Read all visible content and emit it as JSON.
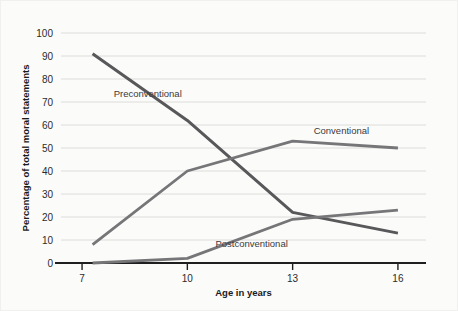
{
  "chart_data": {
    "type": "line",
    "title": "",
    "xlabel": "Age in years",
    "ylabel": "Percentage of total moral statements",
    "x": [
      7,
      10,
      13,
      16
    ],
    "xtick_labels": [
      "7",
      "10",
      "13",
      "16"
    ],
    "ytick_labels": [
      "0",
      "10",
      "20",
      "30",
      "40",
      "50",
      "60",
      "70",
      "80",
      "90",
      "100"
    ],
    "ylim": [
      0,
      100
    ],
    "xlim": [
      6.4,
      16.8
    ],
    "grid": true,
    "legend_position": "inline-labels",
    "series": [
      {
        "name": "Preconventional",
        "values": [
          91,
          62,
          22,
          13
        ],
        "x": [
          7.3,
          10,
          13,
          16
        ],
        "color": "#58585a",
        "label_x": 7.9,
        "label_y": 72,
        "label_anchor": "start"
      },
      {
        "name": "Conventional",
        "values": [
          8,
          40,
          53,
          50
        ],
        "x": [
          7.3,
          10,
          13,
          16
        ],
        "color": "#767678",
        "label_x": 13.6,
        "label_y": 56,
        "label_anchor": "start"
      },
      {
        "name": "Postconventional",
        "values": [
          0,
          2,
          19,
          23
        ],
        "x": [
          7.3,
          10,
          13,
          16
        ],
        "color": "#767678",
        "label_x": 10.8,
        "label_y": 7,
        "label_anchor": "start"
      }
    ],
    "annotations": [
      {
        "text": "Preconventional",
        "x": 7.9,
        "y": 72
      },
      {
        "text": "Conventional",
        "x": 13.6,
        "y": 56
      },
      {
        "text": "Postconventional",
        "x": 10.8,
        "y": 7
      }
    ]
  }
}
